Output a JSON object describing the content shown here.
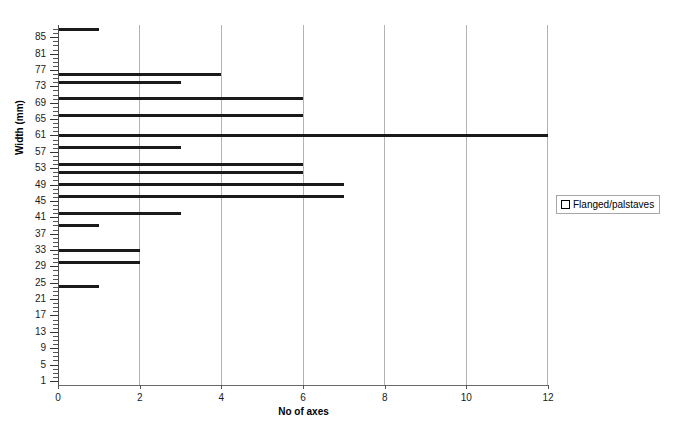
{
  "chart_data": {
    "type": "bar",
    "orientation": "horizontal",
    "title": "",
    "xlabel": "No of axes",
    "ylabel": "Width (mm)",
    "xlim": [
      0,
      12
    ],
    "ylim": [
      0,
      88
    ],
    "xticks": [
      0,
      2,
      4,
      6,
      8,
      10,
      12
    ],
    "yticks": [
      1,
      5,
      9,
      13,
      17,
      21,
      25,
      29,
      33,
      37,
      41,
      45,
      49,
      53,
      57,
      61,
      65,
      69,
      73,
      77,
      81,
      85
    ],
    "ytick_minor_step": 1,
    "grid": "vertical",
    "legend_position": "right",
    "series": [
      {
        "name": "Flanged/palstaves",
        "marker": "hollow-square",
        "color": "#1a1a1a",
        "categories": [
          87,
          76,
          74,
          70,
          66,
          61,
          58,
          54,
          52,
          49,
          46,
          42,
          39,
          33,
          30,
          24
        ],
        "values": [
          1,
          4,
          3,
          6,
          6,
          12,
          3,
          6,
          6,
          7,
          7,
          3,
          1,
          2,
          2,
          1
        ]
      }
    ]
  },
  "legend": {
    "entries": [
      {
        "label": "Flanged/palstaves"
      }
    ]
  }
}
